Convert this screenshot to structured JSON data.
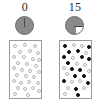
{
  "figure": {
    "title": "",
    "panel_count": 2
  },
  "colors": {
    "dial_fill": "#8a8a8a",
    "dial_empty": "#ffffff",
    "dial_stroke": "#6a6a6a",
    "dot_open_stroke": "#b4b4b4",
    "dot_filled": "#111111",
    "box_stroke": "#9a9a9a",
    "label_text": "#2b2b2b",
    "background": "#ffffff"
  },
  "panels": [
    {
      "id": "panel-left",
      "count_label": "0",
      "dial": {
        "name": "pie-clock-icon",
        "filled_fraction": 1.0,
        "empty_fraction": 0.0,
        "hand_angle_deg": 0,
        "description": "fully shaded dial, pointer at twelve o'clock"
      },
      "dot_field": {
        "total_dots": 30,
        "filled_dots": 0,
        "open_dots": 30,
        "dots": [
          {
            "x": 3,
            "y": 3,
            "filled": false
          },
          {
            "x": 13,
            "y": 2,
            "filled": false
          },
          {
            "x": 23,
            "y": 3,
            "filled": false
          },
          {
            "x": 8,
            "y": 9,
            "filled": false
          },
          {
            "x": 18,
            "y": 8,
            "filled": false
          },
          {
            "x": 26,
            "y": 10,
            "filled": false
          },
          {
            "x": 2,
            "y": 14,
            "filled": false
          },
          {
            "x": 12,
            "y": 14,
            "filled": false
          },
          {
            "x": 21,
            "y": 16,
            "filled": false
          },
          {
            "x": 27,
            "y": 17,
            "filled": false
          },
          {
            "x": 6,
            "y": 20,
            "filled": false
          },
          {
            "x": 15,
            "y": 21,
            "filled": false
          },
          {
            "x": 24,
            "y": 23,
            "filled": false
          },
          {
            "x": 2,
            "y": 25,
            "filled": false
          },
          {
            "x": 10,
            "y": 27,
            "filled": false
          },
          {
            "x": 18,
            "y": 28,
            "filled": false
          },
          {
            "x": 27,
            "y": 29,
            "filled": false
          },
          {
            "x": 5,
            "y": 32,
            "filled": false
          },
          {
            "x": 14,
            "y": 33,
            "filled": false
          },
          {
            "x": 22,
            "y": 34,
            "filled": false
          },
          {
            "x": 2,
            "y": 38,
            "filled": false
          },
          {
            "x": 9,
            "y": 40,
            "filled": false
          },
          {
            "x": 17,
            "y": 39,
            "filled": false
          },
          {
            "x": 26,
            "y": 40,
            "filled": false
          },
          {
            "x": 6,
            "y": 45,
            "filled": false
          },
          {
            "x": 13,
            "y": 46,
            "filled": false
          },
          {
            "x": 21,
            "y": 45,
            "filled": false
          },
          {
            "x": 27,
            "y": 48,
            "filled": false
          },
          {
            "x": 3,
            "y": 51,
            "filled": false
          },
          {
            "x": 16,
            "y": 52,
            "filled": false
          }
        ]
      }
    },
    {
      "id": "panel-right",
      "count_label": "15",
      "dial": {
        "name": "pie-clock-icon",
        "filled_fraction": 0.75,
        "empty_fraction": 0.25,
        "hand_angle_deg": 90,
        "description": "three quarters shaded, upper-right quadrant empty"
      },
      "dot_field": {
        "total_dots": 30,
        "filled_dots": 15,
        "open_dots": 15,
        "dots": [
          {
            "x": 3,
            "y": 3,
            "filled": true
          },
          {
            "x": 12,
            "y": 2,
            "filled": false
          },
          {
            "x": 20,
            "y": 3,
            "filled": false
          },
          {
            "x": 27,
            "y": 4,
            "filled": true
          },
          {
            "x": 7,
            "y": 9,
            "filled": true
          },
          {
            "x": 16,
            "y": 8,
            "filled": true
          },
          {
            "x": 24,
            "y": 10,
            "filled": false
          },
          {
            "x": 2,
            "y": 14,
            "filled": true
          },
          {
            "x": 11,
            "y": 15,
            "filled": false
          },
          {
            "x": 20,
            "y": 14,
            "filled": true
          },
          {
            "x": 27,
            "y": 16,
            "filled": true
          },
          {
            "x": 6,
            "y": 20,
            "filled": true
          },
          {
            "x": 15,
            "y": 21,
            "filled": false
          },
          {
            "x": 23,
            "y": 22,
            "filled": false
          },
          {
            "x": 2,
            "y": 25,
            "filled": false
          },
          {
            "x": 10,
            "y": 26,
            "filled": true
          },
          {
            "x": 18,
            "y": 27,
            "filled": true
          },
          {
            "x": 27,
            "y": 28,
            "filled": false
          },
          {
            "x": 5,
            "y": 31,
            "filled": false
          },
          {
            "x": 13,
            "y": 33,
            "filled": true
          },
          {
            "x": 22,
            "y": 33,
            "filled": true
          },
          {
            "x": 2,
            "y": 38,
            "filled": true
          },
          {
            "x": 10,
            "y": 39,
            "filled": false
          },
          {
            "x": 18,
            "y": 38,
            "filled": false
          },
          {
            "x": 26,
            "y": 40,
            "filled": true
          },
          {
            "x": 6,
            "y": 45,
            "filled": false
          },
          {
            "x": 14,
            "y": 46,
            "filled": true
          },
          {
            "x": 22,
            "y": 45,
            "filled": false
          },
          {
            "x": 3,
            "y": 51,
            "filled": false
          },
          {
            "x": 16,
            "y": 52,
            "filled": true
          }
        ]
      }
    }
  ]
}
